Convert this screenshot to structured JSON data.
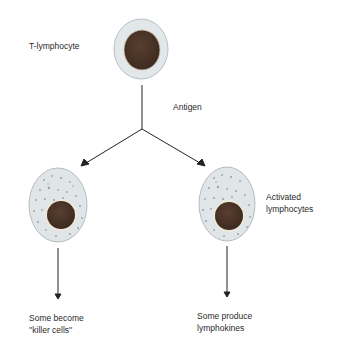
{
  "diagram": {
    "nodes": [
      {
        "id": "t-lymphocyte",
        "label": "T-lymphocyte",
        "type": "resting-cell"
      },
      {
        "id": "activated-left",
        "label": "",
        "type": "activated-cell"
      },
      {
        "id": "activated-right",
        "label": "Activated lymphocytes",
        "type": "activated-cell"
      },
      {
        "id": "killer-outcome",
        "label": "Some become ''killer cells''",
        "type": "outcome"
      },
      {
        "id": "lymphokine-outcome",
        "label": "Some produce lymphokines",
        "type": "outcome"
      }
    ],
    "edges": [
      {
        "from": "t-lymphocyte",
        "to": "activated-left",
        "label": "Antigen"
      },
      {
        "from": "t-lymphocyte",
        "to": "activated-right",
        "label": "Antigen"
      },
      {
        "from": "activated-left",
        "to": "killer-outcome",
        "label": ""
      },
      {
        "from": "activated-right",
        "to": "lymphokine-outcome",
        "label": ""
      }
    ]
  },
  "labels": {
    "t_lymphocyte": "T-lymphocyte",
    "antigen": "Antigen",
    "activated_line1": "Activated",
    "activated_line2": "lymphocytes",
    "killer_line1": "Some become",
    "killer_line2": "''killer cells''",
    "lymphokine_line1": "Some produce",
    "lymphokine_line2": "lymphokines"
  },
  "colors": {
    "cytoplasm": "#dfe4e6",
    "membrane": "#b9bfc2",
    "nucleus": "#4a3226",
    "granules": "#9aa6ad",
    "arrow": "#222222"
  }
}
